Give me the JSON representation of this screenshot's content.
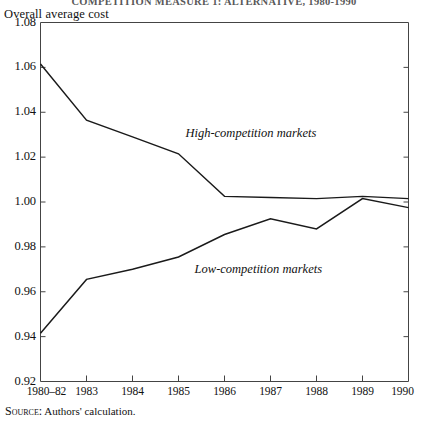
{
  "figure": {
    "title": "COMPETITION MEASURE 1: ALTERNATIVE, 1980-1990",
    "y_axis_title": "Overall average  cost",
    "source_prefix": "Source:",
    "source_text": "Authors' calculation.",
    "line_color": "#1a1a1a",
    "axis_color": "#444444",
    "background": "#ffffff"
  },
  "chart_data": {
    "type": "line",
    "title": "Overall average cost",
    "xlabel": "",
    "ylabel": "Overall average  cost",
    "categories": [
      "1980–82",
      "1983",
      "1984",
      "1985",
      "1986",
      "1987",
      "1988",
      "1989",
      "1990"
    ],
    "x_tick_labels": [
      "1980–82",
      "1983",
      "1984",
      "1985",
      "1986",
      "1987",
      "1988",
      "1989",
      "1990"
    ],
    "y_tick_labels": [
      "1.08",
      "1.06",
      "1.04",
      "1.02",
      "1.00",
      "0.98",
      "0.96",
      "0.94",
      "0.92"
    ],
    "y_ticks": [
      1.08,
      1.06,
      1.04,
      1.02,
      1.0,
      0.98,
      0.96,
      0.94,
      0.92
    ],
    "ylim": [
      0.92,
      1.08
    ],
    "grid": false,
    "legend": "inline-annotations",
    "series": [
      {
        "name": "High-competition markets",
        "label": "High-competition markets",
        "values": [
          1.0615,
          1.0365,
          1.029,
          1.0215,
          1.0025,
          1.002,
          1.0015,
          1.0025,
          1.0015
        ]
      },
      {
        "name": "Low-competition markets",
        "label": "Low-competition markets",
        "values": [
          0.9415,
          0.9655,
          0.97,
          0.9755,
          0.9855,
          0.9925,
          0.988,
          1.0015,
          0.9975
        ]
      }
    ],
    "annotations": [
      {
        "text": "High-competition markets",
        "x": 3.15,
        "y": 1.0305
      },
      {
        "text": "Low-competition markets",
        "x": 3.35,
        "y": 0.9695
      }
    ]
  }
}
